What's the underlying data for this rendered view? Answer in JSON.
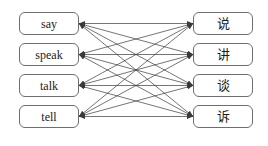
{
  "diagram": {
    "type": "bipartite-mapping",
    "background_color": "#ffffff",
    "box_border_color": "#6e6e6e",
    "edge_color": "#3a3a3a",
    "text_color": "#1a1a1a",
    "left_nodes": [
      {
        "id": "say",
        "label": "say"
      },
      {
        "id": "speak",
        "label": "speak"
      },
      {
        "id": "talk",
        "label": "talk"
      },
      {
        "id": "tell",
        "label": "tell"
      }
    ],
    "right_nodes": [
      {
        "id": "shuo",
        "label": "说"
      },
      {
        "id": "jiang",
        "label": "讲"
      },
      {
        "id": "tan",
        "label": "谈"
      },
      {
        "id": "su",
        "label": "诉"
      }
    ],
    "edges": [
      {
        "from": 0,
        "to": 0,
        "bidirectional": true
      },
      {
        "from": 0,
        "to": 1,
        "bidirectional": true
      },
      {
        "from": 0,
        "to": 2,
        "bidirectional": true
      },
      {
        "from": 0,
        "to": 3,
        "bidirectional": true
      },
      {
        "from": 1,
        "to": 0,
        "bidirectional": true
      },
      {
        "from": 1,
        "to": 1,
        "bidirectional": true
      },
      {
        "from": 1,
        "to": 2,
        "bidirectional": true
      },
      {
        "from": 1,
        "to": 3,
        "bidirectional": true
      },
      {
        "from": 2,
        "to": 0,
        "bidirectional": true
      },
      {
        "from": 2,
        "to": 1,
        "bidirectional": true
      },
      {
        "from": 2,
        "to": 2,
        "bidirectional": true
      },
      {
        "from": 2,
        "to": 3,
        "bidirectional": true
      },
      {
        "from": 3,
        "to": 0,
        "bidirectional": true
      },
      {
        "from": 3,
        "to": 1,
        "bidirectional": true
      },
      {
        "from": 3,
        "to": 2,
        "bidirectional": true
      },
      {
        "from": 3,
        "to": 3,
        "bidirectional": true
      }
    ]
  },
  "layout": {
    "left_box_x": 19,
    "right_box_x": 193,
    "box_width": 60,
    "box_height": 23,
    "row_tops": [
      12,
      43,
      74,
      105
    ]
  }
}
